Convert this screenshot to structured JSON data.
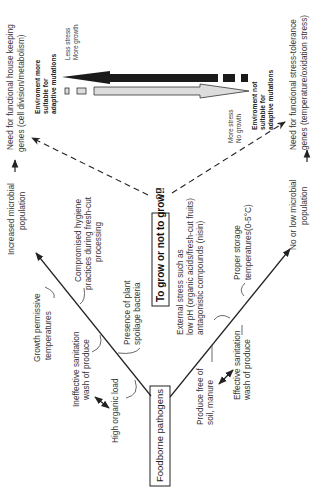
{
  "diagram": {
    "root_box": "Foodborne pathogens",
    "center_box": "To grow or not to grow!!",
    "question_mark": "??",
    "upper_branch": {
      "outcome": [
        "Increased microbial",
        "population"
      ],
      "factors": [
        [
          "Compromised hygiene",
          "practices during fresh-cut",
          "processing"
        ],
        [
          "Growth permissive",
          "temperatures"
        ],
        [
          "Presence of plant",
          "spoilage bacteria"
        ],
        [
          "Ineffective sanitation",
          "wash of produce"
        ],
        [
          "High organic load"
        ]
      ]
    },
    "lower_branch": {
      "outcome": [
        "No or low microbial",
        "population"
      ],
      "factors": [
        [
          "External stress such as",
          "low pH (organic acids/fresh-cut fruits)",
          "antagonistic compounds (nisin)"
        ],
        [
          "Proper storage",
          "temperatures(0-5°C)"
        ],
        [
          "Produce free of",
          "soil, manure"
        ],
        [
          "Effective sanitation",
          "wash of produce"
        ]
      ]
    },
    "top_need": [
      "Need for functional house keeping",
      "genes (cell division/metabolism)"
    ],
    "bottom_need": [
      "Need for functional stress-tolerance",
      "genes (temperature/oxidation stress)"
    ],
    "env_more": [
      "Enviroment more",
      "suitable for",
      "adaptive mutations"
    ],
    "env_not": [
      "Enviroment not",
      "suitable for",
      "adaptive mutations"
    ],
    "less_stress": [
      "Less stress",
      "More growth"
    ],
    "more_stress": [
      "More stress",
      "No growth"
    ]
  }
}
